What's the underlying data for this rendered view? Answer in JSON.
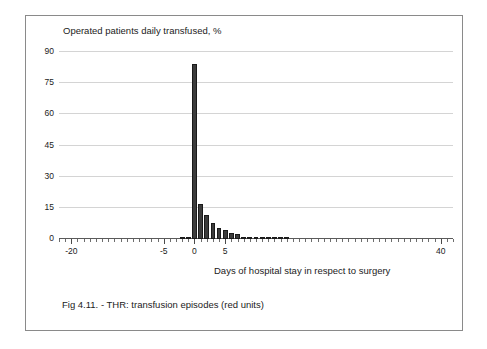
{
  "figure": {
    "caption": "Fig 4.11. - THR: transfusion episodes (red units)"
  },
  "chart_data": {
    "type": "bar",
    "title": "Operated patients daily transfused, %",
    "xlabel": "Days of hospital stay in respect to surgery",
    "ylabel": "",
    "xlim": [
      -22,
      42
    ],
    "ylim": [
      0,
      90
    ],
    "grid": true,
    "legend": null,
    "yticks": [
      0,
      15,
      30,
      45,
      60,
      75,
      90
    ],
    "ytick_labels": [
      "0",
      "15",
      "30",
      "45",
      "60",
      "75",
      "90"
    ],
    "xticks": [
      -20,
      -5,
      0,
      5,
      40
    ],
    "xtick_labels": [
      "-20",
      "-5",
      "0",
      "5",
      "40"
    ],
    "x": [
      -22,
      -21,
      -20,
      -19,
      -18,
      -17,
      -16,
      -15,
      -14,
      -13,
      -12,
      -11,
      -10,
      -9,
      -8,
      -7,
      -6,
      -5,
      -4,
      -3,
      -2,
      -1,
      0,
      1,
      2,
      3,
      4,
      5,
      6,
      7,
      8,
      9,
      10,
      11,
      12,
      13,
      14,
      15,
      16,
      17,
      18,
      19,
      20,
      21,
      22,
      23,
      24,
      25,
      26,
      27,
      28,
      29,
      30,
      31,
      32,
      33,
      34,
      35,
      36,
      37,
      38,
      39,
      40,
      41,
      42
    ],
    "values": [
      0,
      0,
      0,
      0,
      0,
      0,
      0,
      0,
      0,
      0,
      0,
      0,
      0,
      0,
      0,
      0,
      0,
      0,
      0,
      0,
      0.4,
      1.1,
      84.0,
      17.0,
      11.5,
      7.6,
      5.4,
      4.2,
      3.1,
      2.3,
      1.1,
      0.5,
      0.3,
      0.2,
      0.2,
      0.1,
      0.1,
      0.1,
      0,
      0,
      0,
      0,
      0,
      0,
      0,
      0,
      0,
      0,
      0,
      0,
      0,
      0,
      0,
      0,
      0,
      0,
      0,
      0,
      0,
      0,
      0,
      0,
      0,
      0,
      0
    ],
    "bar_color": "#3c3c3c",
    "gridline_color": "#d4d4d4",
    "axis_color": "#5a5a5a"
  }
}
